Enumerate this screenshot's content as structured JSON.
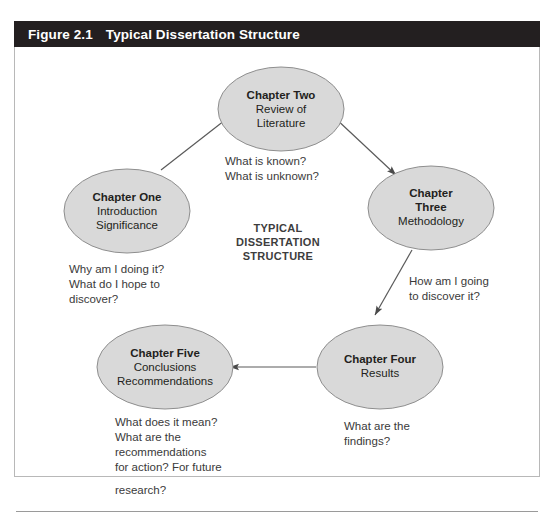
{
  "figure": {
    "label": "Figure 2.1",
    "title": "Typical Dissertation Structure"
  },
  "center_label": {
    "line1": "TYPICAL",
    "line2": "DISSERTATION",
    "line3": "STRUCTURE"
  },
  "nodes": [
    {
      "id": "chapter-one",
      "title": "Chapter One",
      "lines": [
        "Introduction",
        "Significance"
      ]
    },
    {
      "id": "chapter-two",
      "title": "Chapter Two",
      "lines": [
        "Review of",
        "Literature"
      ]
    },
    {
      "id": "chapter-three",
      "title_lines": [
        "Chapter",
        "Three"
      ],
      "title": "Chapter",
      "title2": "Three",
      "lines": [
        "Methodology"
      ]
    },
    {
      "id": "chapter-four",
      "title": "Chapter Four",
      "lines": [
        "Results"
      ]
    },
    {
      "id": "chapter-five",
      "title": "Chapter Five",
      "lines": [
        "Conclusions",
        "Recommendations"
      ]
    }
  ],
  "annotations": {
    "one_to_two": [
      "What is known?",
      "What is unknown?"
    ],
    "below_one": [
      "Why am I doing it?",
      "What do I hope to",
      "discover?"
    ],
    "three_to_four": [
      "How am I going",
      "to discover it?"
    ],
    "below_four": [
      "What are the",
      "findings?"
    ],
    "below_five": [
      "What does it mean?",
      "What are the",
      "recommendations",
      "for action? For future",
      "research?"
    ]
  },
  "colors": {
    "title_bar_bg": "#231f20",
    "title_text": "#ffffff",
    "ellipse_fill": "#d9d9d9",
    "ellipse_stroke": "#8e8e8e",
    "connector": "#5a5a5a",
    "frame_border": "#b8b8b8",
    "body_text": "#231f20"
  }
}
